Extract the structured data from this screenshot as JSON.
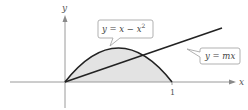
{
  "figure": {
    "type": "area between curves",
    "x_axis_label": "x",
    "y_axis_label": "y",
    "x_tick_label": "1",
    "curves": [
      {
        "id": "parabola",
        "label_prefix": "y = x − x",
        "label_exponent": "2",
        "equation": "y = x - x^2"
      },
      {
        "id": "line",
        "label": "y = mx",
        "equation": "y = mx"
      }
    ],
    "shaded_region": "between y = x − x² and y = mx for 0 ≤ x ≤ intersection, plus under parabola",
    "colors": {
      "axis": "#9a9a9a",
      "curve": "#222222",
      "shade": "#e3e3e3",
      "callout_border": "#a8a8a8"
    }
  }
}
